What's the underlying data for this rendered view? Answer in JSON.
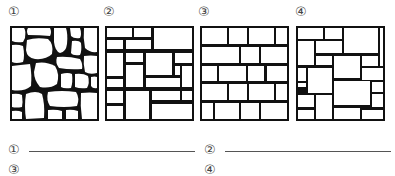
{
  "figures": [
    {
      "label": "①",
      "pattern": "random-rubble-masonry"
    },
    {
      "label": "②",
      "pattern": "irregular-coursed-rectangular-masonry"
    },
    {
      "label": "③",
      "pattern": "regular-coursed-ashlar-masonry"
    },
    {
      "label": "④",
      "pattern": "random-rectangular-ashlar-masonry"
    }
  ],
  "answers": [
    {
      "label": "①",
      "value": ""
    },
    {
      "label": "②",
      "value": ""
    },
    {
      "label": "③",
      "value": ""
    },
    {
      "label": "④",
      "value": ""
    }
  ],
  "colors": {
    "stone": "#ffffff",
    "joint": "#111111"
  }
}
